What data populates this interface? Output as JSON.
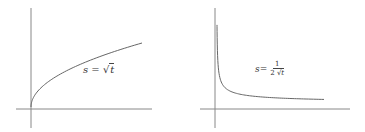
{
  "chart_data": [
    {
      "type": "line",
      "title": "",
      "xlabel": "t",
      "ylabel": "s",
      "annotation": "s = √t",
      "function": "sqrt(t)",
      "x": [
        0,
        0.5,
        1,
        2,
        3,
        4,
        5,
        6,
        7,
        8,
        9
      ],
      "values": [
        0,
        0.707,
        1,
        1.414,
        1.732,
        2,
        2.236,
        2.449,
        2.646,
        2.828,
        3
      ],
      "grid": false,
      "axis_ticks": false
    },
    {
      "type": "line",
      "title": "",
      "xlabel": "t",
      "ylabel": "s",
      "annotation": "s = 1 / (2√t)",
      "function": "1/(2*sqrt(t))",
      "x": [
        0.03,
        0.1,
        0.25,
        0.5,
        1,
        2,
        3,
        4,
        5,
        6,
        7,
        8,
        9
      ],
      "values": [
        2.887,
        1.581,
        1,
        0.707,
        0.5,
        0.354,
        0.289,
        0.25,
        0.224,
        0.204,
        0.189,
        0.177,
        0.167
      ],
      "grid": false,
      "axis_ticks": false
    }
  ],
  "labels": {
    "left": {
      "lhs": "s",
      "eq": " = ",
      "radical": "√",
      "var": "t"
    },
    "right": {
      "lhs": "s",
      "eq": " = ",
      "num": "1",
      "den_coef": "2",
      "radical": "√",
      "var": "t"
    }
  }
}
